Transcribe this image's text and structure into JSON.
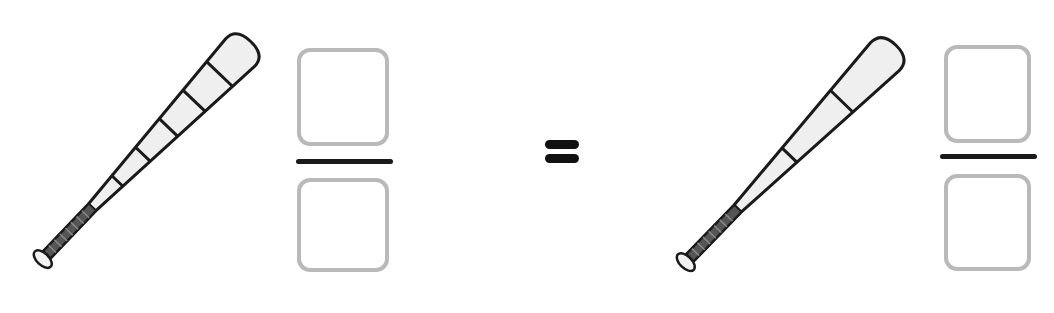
{
  "worksheet": {
    "left": {
      "picture": "baseball-bat",
      "segments": 6,
      "fraction": {
        "numerator_value": "",
        "denominator_value": ""
      }
    },
    "operator": "=",
    "right": {
      "picture": "baseball-bat",
      "segments": 3,
      "fraction": {
        "numerator_value": "",
        "denominator_value": ""
      }
    }
  },
  "colors": {
    "background": "#ffffff",
    "box_border": "#b9b9b9",
    "fraction_line": "#1a1a1a",
    "bat_outline": "#1a1a1a",
    "bat_fill": "#efefef",
    "grip": "#555555"
  }
}
